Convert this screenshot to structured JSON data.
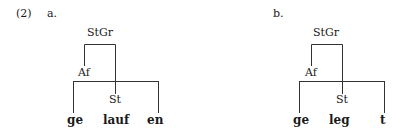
{
  "example_number": "(2)",
  "trees": [
    {
      "label": "a.",
      "root": "StGr",
      "affix_node": "Af",
      "stem_node": "St",
      "words": [
        "ge",
        "lauf",
        "en"
      ]
    },
    {
      "label": "b.",
      "root": "StGr",
      "affix_node": "Af",
      "stem_node": "St",
      "words": [
        "ge",
        "leg",
        "t"
      ]
    }
  ]
}
